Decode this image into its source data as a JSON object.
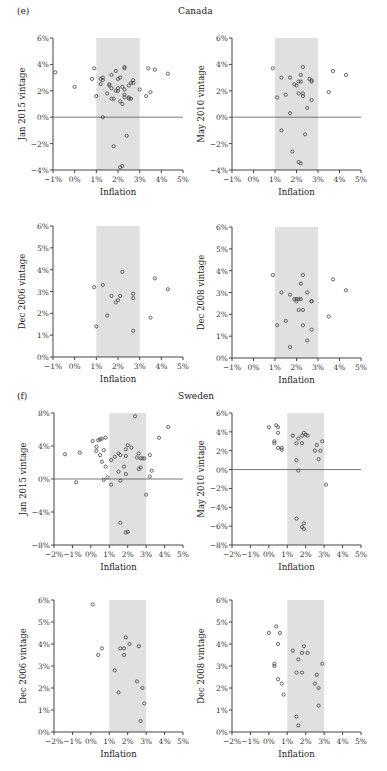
{
  "figure": {
    "sections": [
      {
        "tag": "(e)",
        "country": "Canada"
      },
      {
        "tag": "(f)",
        "country": "Sweden"
      }
    ]
  },
  "style": {
    "band_color": "#e0e0e0",
    "axis_color": "#444444",
    "zero_line_color": "#555555",
    "marker_stroke": "#444444"
  },
  "chart_data": [
    {
      "type": "scatter",
      "section": "(e) Canada",
      "title": "Canada",
      "xlabel": "Inflation",
      "ylabel": "Jan 2015 vintage",
      "xlim": [
        -1,
        5
      ],
      "ylim": [
        -4,
        6
      ],
      "xticks": [
        "-1%",
        "0%",
        "1%",
        "2%",
        "3%",
        "4%",
        "5%"
      ],
      "yticks": [
        "-4%",
        "-2%",
        "0%",
        "2%",
        "4%",
        "6%"
      ],
      "target_band": [
        1,
        3
      ],
      "zero_line": true,
      "points": [
        [
          -0.9,
          3.4
        ],
        [
          0.0,
          2.3
        ],
        [
          0.8,
          2.9
        ],
        [
          0.9,
          3.7
        ],
        [
          1.0,
          1.6
        ],
        [
          1.2,
          2.5
        ],
        [
          1.2,
          2.9
        ],
        [
          1.3,
          3.0
        ],
        [
          1.3,
          2.8
        ],
        [
          1.3,
          0.0
        ],
        [
          1.5,
          1.8
        ],
        [
          1.6,
          2.5
        ],
        [
          1.6,
          2.4
        ],
        [
          1.7,
          3.2
        ],
        [
          1.7,
          2.2
        ],
        [
          1.7,
          1.4
        ],
        [
          1.8,
          1.4
        ],
        [
          1.8,
          -2.2
        ],
        [
          1.9,
          3.5
        ],
        [
          1.9,
          2.0
        ],
        [
          2.0,
          2.0
        ],
        [
          2.0,
          2.2
        ],
        [
          2.0,
          2.9
        ],
        [
          2.1,
          1.2
        ],
        [
          2.1,
          3.0
        ],
        [
          2.2,
          2.3
        ],
        [
          2.2,
          1.0
        ],
        [
          2.2,
          -3.7
        ],
        [
          2.3,
          3.8
        ],
        [
          2.3,
          3.7
        ],
        [
          2.3,
          2.1
        ],
        [
          2.3,
          1.7
        ],
        [
          2.3,
          1.5
        ],
        [
          2.4,
          -1.4
        ],
        [
          2.5,
          1.4
        ],
        [
          2.5,
          2.4
        ],
        [
          2.5,
          1.5
        ],
        [
          2.6,
          2.6
        ],
        [
          2.6,
          1.4
        ],
        [
          2.7,
          2.8
        ],
        [
          2.7,
          2.6
        ],
        [
          3.0,
          2.1
        ],
        [
          3.3,
          1.6
        ],
        [
          3.4,
          3.7
        ],
        [
          3.5,
          1.9
        ],
        [
          3.7,
          3.6
        ],
        [
          4.3,
          3.3
        ],
        [
          2.1,
          -3.8
        ]
      ]
    },
    {
      "type": "scatter",
      "section": "(e) Canada",
      "xlabel": "Inflation",
      "ylabel": "May 2010 vintage",
      "xlim": [
        -1,
        5
      ],
      "ylim": [
        -4,
        6
      ],
      "xticks": [
        "-1%",
        "0%",
        "1%",
        "2%",
        "3%",
        "4%",
        "5%"
      ],
      "yticks": [
        "-4%",
        "-2%",
        "0%",
        "2%",
        "4%",
        "6%"
      ],
      "target_band": [
        1,
        3
      ],
      "zero_line": true,
      "points": [
        [
          0.9,
          3.7
        ],
        [
          1.1,
          1.5
        ],
        [
          1.3,
          3.0
        ],
        [
          1.3,
          -1.0
        ],
        [
          1.5,
          1.7
        ],
        [
          1.7,
          3.0
        ],
        [
          1.7,
          0.3
        ],
        [
          1.8,
          -2.6
        ],
        [
          1.9,
          2.5
        ],
        [
          2.0,
          2.4
        ],
        [
          2.1,
          2.7
        ],
        [
          2.1,
          1.8
        ],
        [
          2.1,
          -3.4
        ],
        [
          2.2,
          3.2
        ],
        [
          2.2,
          2.7
        ],
        [
          2.2,
          -3.5
        ],
        [
          2.3,
          3.8
        ],
        [
          2.3,
          1.8
        ],
        [
          2.3,
          1.6
        ],
        [
          2.4,
          -1.3
        ],
        [
          2.5,
          0.7
        ],
        [
          2.6,
          2.9
        ],
        [
          2.7,
          1.3
        ],
        [
          2.7,
          2.8
        ],
        [
          2.7,
          2.7
        ],
        [
          3.5,
          1.9
        ],
        [
          3.7,
          3.5
        ],
        [
          4.3,
          3.2
        ]
      ]
    },
    {
      "type": "scatter",
      "section": "(e) Canada",
      "xlabel": "Inflation",
      "ylabel": "Dec 2006 vintage",
      "xlim": [
        -1,
        5
      ],
      "ylim": [
        0,
        6
      ],
      "xticks": [
        "-1%",
        "0%",
        "1%",
        "2%",
        "3%",
        "4%",
        "5%"
      ],
      "yticks": [
        "0%",
        "1%",
        "2%",
        "3%",
        "4%",
        "5%",
        "6%"
      ],
      "target_band": [
        1,
        3
      ],
      "zero_line": false,
      "points": [
        [
          0.9,
          3.2
        ],
        [
          1.0,
          1.4
        ],
        [
          1.3,
          3.3
        ],
        [
          1.5,
          1.9
        ],
        [
          1.7,
          2.8
        ],
        [
          1.9,
          2.5
        ],
        [
          2.0,
          2.6
        ],
        [
          2.1,
          2.8
        ],
        [
          2.2,
          3.9
        ],
        [
          2.7,
          2.7
        ],
        [
          2.7,
          2.9
        ],
        [
          2.7,
          1.2
        ],
        [
          3.5,
          1.8
        ],
        [
          3.7,
          3.6
        ],
        [
          4.3,
          3.1
        ]
      ]
    },
    {
      "type": "scatter",
      "section": "(e) Canada",
      "xlabel": "Inflation",
      "ylabel": "Dec 2008 vintage",
      "xlim": [
        -1,
        5
      ],
      "ylim": [
        0,
        6
      ],
      "xticks": [
        "-1%",
        "0%",
        "1%",
        "2%",
        "3%",
        "4%",
        "5%"
      ],
      "yticks": [
        "0%",
        "1%",
        "2%",
        "3%",
        "4%",
        "5%",
        "6%"
      ],
      "target_band": [
        1,
        3
      ],
      "zero_line": false,
      "points": [
        [
          0.9,
          3.8
        ],
        [
          1.1,
          1.5
        ],
        [
          1.3,
          3.0
        ],
        [
          1.5,
          1.7
        ],
        [
          1.7,
          2.9
        ],
        [
          1.7,
          0.5
        ],
        [
          1.9,
          2.7
        ],
        [
          2.0,
          2.7
        ],
        [
          2.0,
          2.6
        ],
        [
          2.1,
          2.2
        ],
        [
          2.1,
          2.7
        ],
        [
          2.2,
          3.4
        ],
        [
          2.2,
          2.7
        ],
        [
          2.3,
          3.8
        ],
        [
          2.3,
          2.2
        ],
        [
          2.3,
          1.5
        ],
        [
          2.5,
          3.0
        ],
        [
          2.5,
          0.8
        ],
        [
          2.7,
          2.6
        ],
        [
          2.7,
          2.6
        ],
        [
          2.7,
          1.3
        ],
        [
          3.5,
          1.9
        ],
        [
          3.7,
          3.6
        ],
        [
          4.3,
          3.1
        ]
      ]
    },
    {
      "type": "scatter",
      "section": "(f) Sweden",
      "title": "Sweden",
      "xlabel": "Inflation",
      "ylabel": "Jan 2015 vintage",
      "xlim": [
        -2,
        5
      ],
      "ylim": [
        -8,
        8
      ],
      "xticks": [
        "-2%",
        "-1%",
        "0%",
        "1%",
        "2%",
        "3%",
        "4%",
        "5%"
      ],
      "yticks": [
        "-8%",
        "-4%",
        "0%",
        "4%",
        "8%"
      ],
      "target_band": [
        1,
        3
      ],
      "zero_line": true,
      "points": [
        [
          -1.4,
          3.0
        ],
        [
          -0.8,
          -0.4
        ],
        [
          -0.6,
          3.2
        ],
        [
          0.1,
          4.6
        ],
        [
          0.3,
          3.9
        ],
        [
          0.3,
          3.4
        ],
        [
          0.4,
          4.7
        ],
        [
          0.5,
          4.8
        ],
        [
          0.5,
          2.9
        ],
        [
          0.6,
          4.9
        ],
        [
          0.6,
          2.1
        ],
        [
          0.7,
          -0.1
        ],
        [
          0.7,
          3.5
        ],
        [
          0.8,
          5.0
        ],
        [
          0.8,
          1.5
        ],
        [
          0.9,
          0.2
        ],
        [
          1.1,
          2.3
        ],
        [
          1.1,
          -0.7
        ],
        [
          1.3,
          2.7
        ],
        [
          1.5,
          0.9
        ],
        [
          1.5,
          3.1
        ],
        [
          1.6,
          2.9
        ],
        [
          1.6,
          -0.2
        ],
        [
          1.6,
          -5.3
        ],
        [
          1.8,
          1.5
        ],
        [
          1.9,
          3.6
        ],
        [
          1.9,
          2.8
        ],
        [
          1.9,
          0.6
        ],
        [
          1.9,
          -6.5
        ],
        [
          2.0,
          -6.4
        ],
        [
          2.0,
          4.1
        ],
        [
          2.2,
          3.8
        ],
        [
          2.4,
          7.6
        ],
        [
          2.5,
          2.6
        ],
        [
          2.6,
          1.2
        ],
        [
          2.6,
          3.1
        ],
        [
          2.7,
          1.4
        ],
        [
          2.7,
          2.5
        ],
        [
          2.8,
          2.5
        ],
        [
          2.9,
          2.5
        ],
        [
          3.0,
          -1.9
        ],
        [
          3.2,
          2.9
        ],
        [
          3.2,
          0.3
        ],
        [
          3.3,
          1.0
        ],
        [
          3.7,
          5.0
        ],
        [
          4.2,
          6.3
        ]
      ]
    },
    {
      "type": "scatter",
      "section": "(f) Sweden",
      "xlabel": "Inflation",
      "ylabel": "May 2010 vintage",
      "xlim": [
        -2,
        5
      ],
      "ylim": [
        -8,
        6
      ],
      "xticks": [
        "-2%",
        "-1%",
        "0%",
        "1%",
        "2%",
        "3%",
        "4%",
        "5%"
      ],
      "yticks": [
        "-8%",
        "-6%",
        "-4%",
        "-2%",
        "0%",
        "2%",
        "4%",
        "6%"
      ],
      "target_band": [
        1,
        3
      ],
      "zero_line": true,
      "points": [
        [
          0.0,
          4.5
        ],
        [
          0.3,
          3.0
        ],
        [
          0.3,
          2.8
        ],
        [
          0.4,
          4.7
        ],
        [
          0.5,
          4.5
        ],
        [
          0.5,
          3.9
        ],
        [
          0.5,
          2.3
        ],
        [
          0.7,
          2.3
        ],
        [
          0.7,
          2.1
        ],
        [
          1.3,
          3.6
        ],
        [
          1.5,
          2.8
        ],
        [
          1.5,
          1.0
        ],
        [
          1.6,
          3.3
        ],
        [
          1.6,
          -0.1
        ],
        [
          1.5,
          -5.2
        ],
        [
          1.8,
          3.6
        ],
        [
          1.8,
          2.8
        ],
        [
          1.8,
          -6.1
        ],
        [
          1.9,
          3.9
        ],
        [
          1.9,
          -5.7
        ],
        [
          1.9,
          -6.3
        ],
        [
          2.0,
          3.7
        ],
        [
          2.1,
          3.6
        ],
        [
          2.5,
          2.0
        ],
        [
          2.6,
          2.6
        ],
        [
          2.7,
          1.1
        ],
        [
          2.8,
          2.0
        ],
        [
          2.9,
          3.0
        ],
        [
          3.1,
          -1.6
        ]
      ]
    },
    {
      "type": "scatter",
      "section": "(f) Sweden",
      "xlabel": "Inflation",
      "ylabel": "Dec 2006 vintage",
      "xlim": [
        -2,
        5
      ],
      "ylim": [
        0,
        6
      ],
      "xticks": [
        "-2%",
        "-1%",
        "0%",
        "1%",
        "2%",
        "3%",
        "4%",
        "5%"
      ],
      "yticks": [
        "0%",
        "1%",
        "2%",
        "3%",
        "4%",
        "5%",
        "6%"
      ],
      "target_band": [
        1,
        3
      ],
      "zero_line": false,
      "points": [
        [
          0.1,
          5.8
        ],
        [
          0.4,
          3.5
        ],
        [
          0.6,
          3.8
        ],
        [
          1.3,
          2.8
        ],
        [
          1.5,
          1.8
        ],
        [
          1.6,
          3.8
        ],
        [
          1.8,
          3.8
        ],
        [
          1.8,
          3.5
        ],
        [
          1.9,
          4.3
        ],
        [
          2.1,
          4.0
        ],
        [
          2.5,
          2.3
        ],
        [
          2.6,
          3.9
        ],
        [
          2.7,
          0.5
        ],
        [
          2.8,
          2.0
        ],
        [
          2.9,
          1.3
        ]
      ]
    },
    {
      "type": "scatter",
      "section": "(f) Sweden",
      "xlabel": "Inflation",
      "ylabel": "Dec 2008 vintage",
      "xlim": [
        -2,
        5
      ],
      "ylim": [
        0,
        6
      ],
      "xticks": [
        "-2%",
        "-1%",
        "0%",
        "1%",
        "2%",
        "3%",
        "4%",
        "5%"
      ],
      "yticks": [
        "0%",
        "1%",
        "2%",
        "3%",
        "4%",
        "5%",
        "6%"
      ],
      "target_band": [
        1,
        3
      ],
      "zero_line": false,
      "points": [
        [
          0.0,
          4.5
        ],
        [
          0.3,
          3.1
        ],
        [
          0.3,
          3.0
        ],
        [
          0.4,
          4.8
        ],
        [
          0.5,
          4.0
        ],
        [
          0.5,
          2.4
        ],
        [
          0.6,
          4.5
        ],
        [
          0.7,
          2.2
        ],
        [
          0.8,
          1.7
        ],
        [
          1.3,
          3.7
        ],
        [
          1.5,
          2.7
        ],
        [
          1.5,
          0.7
        ],
        [
          1.6,
          3.3
        ],
        [
          1.6,
          0.3
        ],
        [
          1.8,
          3.6
        ],
        [
          1.8,
          2.7
        ],
        [
          1.9,
          3.9
        ],
        [
          2.1,
          3.6
        ],
        [
          2.5,
          2.2
        ],
        [
          2.6,
          2.6
        ],
        [
          2.7,
          2.0
        ],
        [
          2.7,
          1.2
        ],
        [
          2.9,
          3.1
        ]
      ]
    }
  ]
}
